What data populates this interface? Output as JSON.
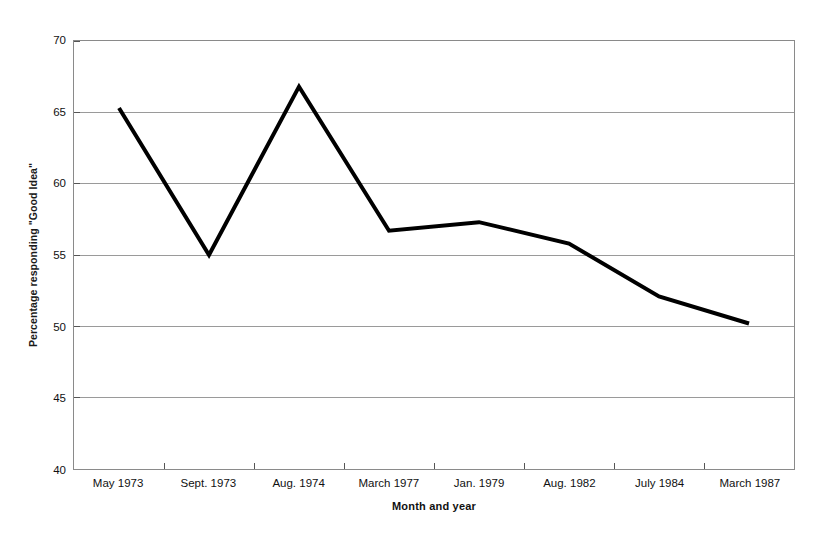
{
  "chart_data": {
    "type": "line",
    "title": "",
    "xlabel": "Month and year",
    "ylabel": "Percentage responding \"Good Idea\"",
    "categories": [
      "May 1973",
      "Sept. 1973",
      "Aug. 1974",
      "March 1977",
      "Jan. 1979",
      "Aug. 1982",
      "July 1984",
      "March 1987"
    ],
    "values": [
      65.3,
      55.0,
      66.8,
      56.7,
      57.3,
      55.8,
      52.1,
      50.2
    ],
    "series": [
      {
        "name": "Percentage responding \"Good Idea\"",
        "values": [
          65.3,
          55.0,
          66.8,
          56.7,
          57.3,
          55.8,
          52.1,
          50.2
        ]
      }
    ],
    "ylim": [
      40,
      70
    ],
    "yticks": [
      70,
      65,
      60,
      55,
      50,
      45,
      40
    ],
    "ytick_labels": [
      "70",
      "65",
      "60",
      "55",
      "50",
      "45",
      "40"
    ],
    "grid": "horizontal",
    "legend": "none",
    "line_color": "#000000",
    "grid_color": "#9a9a9a",
    "frame_color": "#8a8a8a"
  }
}
